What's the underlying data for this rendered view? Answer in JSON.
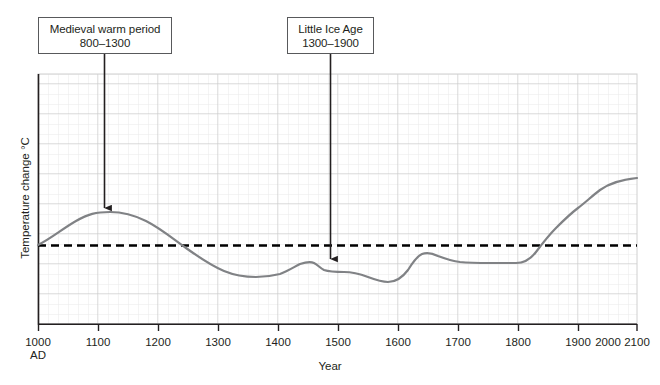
{
  "chart_data": {
    "type": "line",
    "title": "",
    "xlabel": "Year",
    "ylabel": "Temperature change °C",
    "xlim": [
      1000,
      2100
    ],
    "ylim": [
      -1.0,
      1.0
    ],
    "grid": true,
    "legend": "none",
    "x_tick_labels": [
      "1000",
      "1100",
      "1200",
      "1300",
      "1400",
      "1500",
      "1600",
      "1700",
      "1800",
      "1900",
      "2000",
      "2100"
    ],
    "x_first_tick_sublabel": "AD",
    "y_tick_labels": [],
    "reference_line": {
      "name": "zero-baseline",
      "value": 0,
      "style": "dashed",
      "color": "#000000"
    },
    "series": [
      {
        "name": "global-temperature-anomaly",
        "color": "#808285",
        "x": [
          1000,
          1050,
          1100,
          1150,
          1200,
          1250,
          1300,
          1350,
          1400,
          1450,
          1500,
          1530,
          1560,
          1600,
          1625,
          1650,
          1680,
          1700,
          1720,
          1750,
          1800,
          1850,
          1880,
          1900,
          1920,
          1940,
          1960,
          1980,
          2000,
          2020,
          2050,
          2100
        ],
        "y": [
          0.0,
          0.2,
          0.33,
          0.33,
          0.28,
          0.15,
          0.0,
          -0.12,
          -0.22,
          -0.3,
          -0.27,
          -0.19,
          -0.23,
          -0.25,
          -0.3,
          -0.36,
          -0.34,
          -0.2,
          -0.09,
          -0.11,
          -0.14,
          -0.14,
          -0.16,
          -0.16,
          -0.05,
          0.07,
          0.17,
          0.3,
          0.45,
          0.55,
          0.7,
          0.88
        ]
      }
    ],
    "annotations": [
      {
        "name": "medieval-warm-period",
        "title": "Medieval warm period",
        "range": "800–1300",
        "points_to_year": 1110,
        "points_to_value": 0.33
      },
      {
        "name": "little-ice-age",
        "title": "Little Ice Age",
        "range": "1300–1900",
        "points_to_year": 1487,
        "points_to_value": -0.21
      }
    ]
  },
  "colors": {
    "curve": "#808285",
    "axis": "#231f20",
    "grid_minor": "#e8e8e8",
    "grid_major": "#c9c9c9",
    "box_border": "#58595b",
    "arrow": "#231f20",
    "text": "#231f20"
  }
}
